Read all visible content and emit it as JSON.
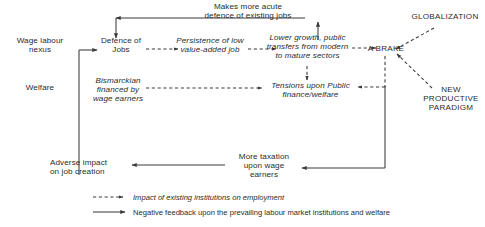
{
  "diagram": {
    "nodes": [
      {
        "id": "wage-labour-nexus",
        "label": "Wage labour\nnexus",
        "style": "plain"
      },
      {
        "id": "welfare",
        "label": "Welfare",
        "style": "plain"
      },
      {
        "id": "defence-of-jobs",
        "label": "Defence of\nJobs",
        "style": "plain"
      },
      {
        "id": "makes-more-acute",
        "label": "Makes more acute\ndefence of existing jobs",
        "style": "plain"
      },
      {
        "id": "persistence-low-value",
        "label": "Persistence of low\nvalue-added job",
        "style": "italic"
      },
      {
        "id": "bismarckian",
        "label": "Bismarckian\nfinanced by\nwage earners",
        "style": "italic"
      },
      {
        "id": "lower-growth",
        "label": "Lower growth, public\ntransfers from modern\nto mature sectors",
        "style": "italic"
      },
      {
        "id": "tensions-public-finance",
        "label": "Tensions upon Public\nfinance/welfare",
        "style": "italic"
      },
      {
        "id": "a-brake",
        "label": "A BRAKE",
        "style": "caps"
      },
      {
        "id": "globalization",
        "label": "GLOBALIZATION",
        "style": "caps"
      },
      {
        "id": "new-productive-paradigm",
        "label": "NEW\nPRODUCTIVE\nPARADIGM",
        "style": "caps"
      },
      {
        "id": "adverse-impact",
        "label": "Adverse impact\non job creation",
        "style": "plain"
      },
      {
        "id": "more-taxation",
        "label": "More taxation\nupon wage\nearners",
        "style": "plain"
      }
    ],
    "legend": [
      {
        "id": "legend-dashed",
        "marker": "dashed-arrow",
        "label": "Impact of existing institutions on employment"
      },
      {
        "id": "legend-solid",
        "marker": "solid-arrow",
        "label": "Negative feedback upon the prevailing labour market institutions and welfare"
      }
    ],
    "colors": {
      "ink": "#2b2b2b",
      "line": "#3a3a3a",
      "background": "#ffffff"
    }
  }
}
